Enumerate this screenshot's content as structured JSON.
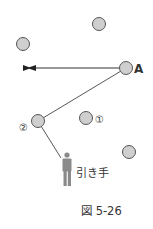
{
  "diagram": {
    "colors": {
      "ball_fill": "#cfcfcf",
      "ball_stroke": "#555555",
      "line": "#333333",
      "person": "#8a8a8a",
      "text": "#333333"
    },
    "balls": [
      {
        "id": "top",
        "cx": 99,
        "cy": 24,
        "label": ""
      },
      {
        "id": "left",
        "cx": 23,
        "cy": 44,
        "label": ""
      },
      {
        "id": "A",
        "cx": 126,
        "cy": 68,
        "label": "A"
      },
      {
        "id": "2",
        "cx": 38,
        "cy": 121,
        "label": "②"
      },
      {
        "id": "1",
        "cx": 86,
        "cy": 118,
        "label": "①"
      },
      {
        "id": "lower-right",
        "cx": 129,
        "cy": 152,
        "label": ""
      }
    ],
    "labels": {
      "a": "A",
      "one": "①",
      "two": "②",
      "puller": "引き手"
    },
    "caption": "図 5-26"
  }
}
